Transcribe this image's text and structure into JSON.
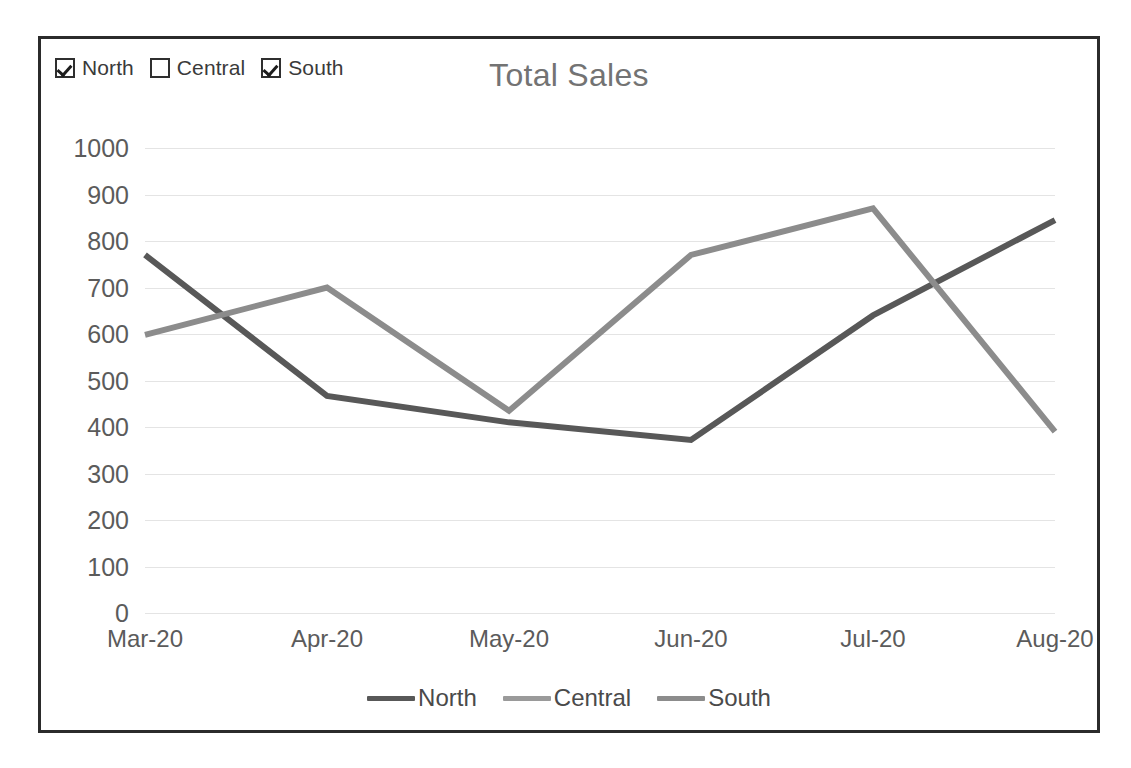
{
  "chart_frame": {
    "border_color": "#2b2b2b",
    "background": "#ffffff"
  },
  "series_toggles": [
    {
      "label": "North",
      "checked": true,
      "icon": "checkbox-checked-icon"
    },
    {
      "label": "Central",
      "checked": false,
      "icon": "checkbox-unchecked-icon"
    },
    {
      "label": "South",
      "checked": true,
      "icon": "checkbox-checked-icon"
    }
  ],
  "legend": {
    "position": "bottom",
    "entries": [
      {
        "label": "North",
        "color": "#585858"
      },
      {
        "label": "Central",
        "color": "#9a9a9a"
      },
      {
        "label": "South",
        "color": "#8c8c8c"
      }
    ]
  },
  "chart_data": {
    "type": "line",
    "title": "Total Sales",
    "xlabel": "",
    "ylabel": "",
    "categories": [
      "Mar-20",
      "Apr-20",
      "May-20",
      "Jun-20",
      "Jul-20",
      "Aug-20"
    ],
    "ylim": [
      0,
      1000
    ],
    "ytick_step": 100,
    "yticks": [
      1000,
      900,
      800,
      700,
      600,
      500,
      400,
      300,
      200,
      100,
      0
    ],
    "grid": true,
    "grid_color": "#e4e4e4",
    "legend_position": "bottom",
    "series": [
      {
        "name": "North",
        "color": "#585858",
        "visible": true,
        "values": [
          770,
          467,
          410,
          372,
          640,
          845
        ]
      },
      {
        "name": "Central",
        "color": "#9a9a9a",
        "visible": false,
        "values": [
          null,
          null,
          null,
          null,
          null,
          null
        ]
      },
      {
        "name": "South",
        "color": "#8c8c8c",
        "visible": true,
        "values": [
          598,
          700,
          435,
          770,
          870,
          390
        ]
      }
    ]
  }
}
